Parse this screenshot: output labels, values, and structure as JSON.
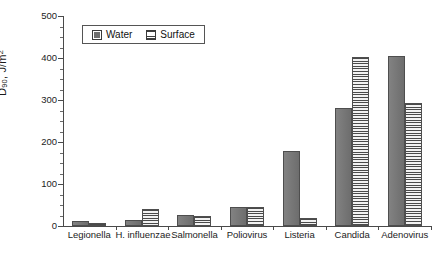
{
  "chart_data": {
    "type": "bar",
    "title": "",
    "subtitle": "",
    "xlabel": "",
    "ylabel": "D90, J/m2",
    "ylabel_parts": {
      "base": "D",
      "sub": "90",
      "tail": ", J/m",
      "sup": "2"
    },
    "ylim": [
      0,
      500
    ],
    "y_major_ticks": [
      0,
      100,
      200,
      300,
      400,
      500
    ],
    "y_minor_tick_interval": 25,
    "grid": false,
    "legend_position": "top-left-inside",
    "categories": [
      "Legionella",
      "H. influenzae",
      "Salmonella",
      "Poliovirus",
      "Listeria",
      "Candida",
      "Adenovirus"
    ],
    "series": [
      {
        "name": "Water",
        "fill": "solid-gray",
        "color": "#787878",
        "values": [
          13,
          15,
          27,
          45,
          178,
          282,
          405
        ]
      },
      {
        "name": "Surface",
        "fill": "horizontal-stripes",
        "color": "#4a4a4a",
        "values": [
          8,
          40,
          25,
          45,
          18,
          403,
          293
        ]
      }
    ]
  },
  "legend": {
    "entries": [
      {
        "label": "Water",
        "swatch": "solid-gray-swatch"
      },
      {
        "label": "Surface",
        "swatch": "striped-swatch"
      }
    ]
  },
  "axis": {
    "y_tick_labels": [
      "500",
      "400",
      "300",
      "200",
      "100",
      "0"
    ]
  },
  "caption": {
    "text": ""
  }
}
